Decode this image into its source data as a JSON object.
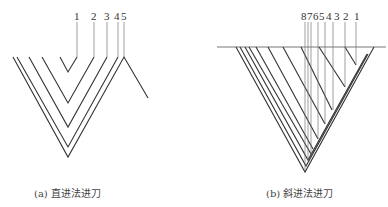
{
  "figure_a": {
    "caption": "(a) 直进法进刀",
    "labels": [
      "1",
      "2",
      "3",
      "4",
      "5"
    ]
  },
  "figure_b": {
    "caption": "(b) 斜进法进刀",
    "labels": [
      "8",
      "7",
      "6",
      "5",
      "4",
      "3",
      "2",
      "1"
    ]
  },
  "colors": {
    "line": "#333333",
    "thin_line": "#777777",
    "background": "#ffffff"
  }
}
